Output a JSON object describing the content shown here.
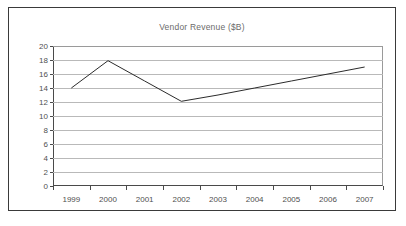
{
  "chart_data": {
    "type": "line",
    "title": "Vendor Revenue ($B)",
    "xlabel": "",
    "ylabel": "",
    "categories": [
      "1999",
      "2000",
      "2001",
      "2002",
      "2003",
      "2004",
      "2005",
      "2006",
      "2007"
    ],
    "series": [
      {
        "name": "Vendor Revenue",
        "values": [
          14.0,
          17.9,
          15.0,
          12.1,
          13.0,
          14.0,
          15.0,
          16.0,
          17.0
        ]
      }
    ],
    "ylim": [
      0,
      20
    ],
    "ytick_step": 2,
    "yticks": [
      0,
      2,
      4,
      6,
      8,
      10,
      12,
      14,
      16,
      18,
      20
    ],
    "grid": "horizontal",
    "legend": "none",
    "markers": "none",
    "line_color": "#2b2b2b",
    "gridline_color": "#b9b9b9",
    "axis_color": "#4a4a4a",
    "title_color": "#6b6b6b",
    "background_color": "#ffffff",
    "border_color": "#3a3a3a"
  }
}
